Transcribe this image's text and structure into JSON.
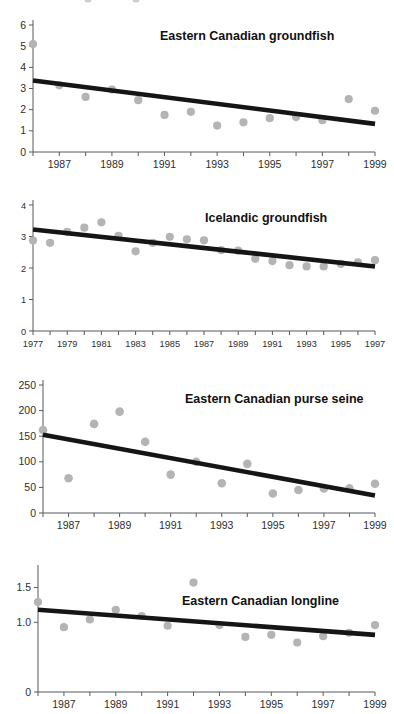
{
  "figure": {
    "background": "#ffffff",
    "point_color": "#b4b4b4",
    "trend_color": "#151515",
    "axis_color": "#555b5e",
    "title_color": "#111111"
  },
  "chart_data": [
    {
      "id": "eastern-canadian-groundfish",
      "type": "scatter",
      "title": "Eastern Canadian groundfish",
      "xlabel": "",
      "ylabel": "",
      "xlim": [
        1986,
        1999
      ],
      "ylim": [
        0,
        6
      ],
      "yticks": [
        0,
        1,
        2,
        3,
        4,
        5,
        6
      ],
      "ytick_labels": [
        "0",
        "1",
        "2",
        "3",
        "4",
        "5",
        "6"
      ],
      "xticks": [
        1986,
        1987,
        1988,
        1989,
        1990,
        1991,
        1992,
        1993,
        1994,
        1995,
        1996,
        1997,
        1998,
        1999
      ],
      "xtick_labels": [
        "",
        "1987",
        "",
        "1989",
        "",
        "1991",
        "",
        "1993",
        "",
        "1995",
        "",
        "1997",
        "",
        "1999"
      ],
      "grid": false,
      "legend": "none",
      "x": [
        1986,
        1987,
        1988,
        1989,
        1990,
        1991,
        1992,
        1993,
        1994,
        1995,
        1996,
        1997,
        1998,
        1999
      ],
      "y": [
        5.1,
        3.15,
        2.6,
        2.95,
        2.45,
        1.75,
        1.9,
        1.25,
        1.4,
        1.6,
        1.65,
        1.5,
        2.5,
        1.95
      ],
      "trendline": {
        "x": [
          1986,
          1999
        ],
        "y": [
          3.38,
          1.33
        ]
      }
    },
    {
      "id": "icelandic-groundfish",
      "type": "scatter",
      "title": "Icelandic groundfish",
      "xlabel": "",
      "ylabel": "",
      "xlim": [
        1977,
        1997
      ],
      "ylim": [
        0,
        4
      ],
      "yticks": [
        0,
        1,
        2,
        3,
        4
      ],
      "ytick_labels": [
        "0",
        "1",
        "2",
        "3",
        "4"
      ],
      "xticks": [
        1977,
        1978,
        1979,
        1980,
        1981,
        1982,
        1983,
        1984,
        1985,
        1986,
        1987,
        1988,
        1989,
        1990,
        1991,
        1992,
        1993,
        1994,
        1995,
        1996,
        1997
      ],
      "xtick_labels": [
        "1977",
        "",
        "1979",
        "",
        "1981",
        "",
        "1983",
        "",
        "1985",
        "",
        "1987",
        "",
        "1989",
        "",
        "1991",
        "",
        "1993",
        "",
        "1995",
        "",
        "1997"
      ],
      "grid": false,
      "legend": "none",
      "x": [
        1977,
        1978,
        1979,
        1980,
        1981,
        1982,
        1983,
        1984,
        1985,
        1986,
        1987,
        1988,
        1989,
        1990,
        1991,
        1992,
        1993,
        1994,
        1995,
        1996,
        1997
      ],
      "y": [
        2.87,
        2.8,
        3.15,
        3.28,
        3.45,
        3.02,
        2.53,
        2.8,
        2.99,
        2.91,
        2.88,
        2.57,
        2.55,
        2.29,
        2.22,
        2.09,
        2.05,
        2.05,
        2.13,
        2.18,
        2.25
      ],
      "trendline": {
        "x": [
          1977,
          1997
        ],
        "y": [
          3.22,
          2.05
        ]
      }
    },
    {
      "id": "eastern-canadian-purse-seine",
      "type": "scatter",
      "title": "Eastern Canadian purse seine",
      "xlabel": "",
      "ylabel": "",
      "xlim": [
        1986,
        1999
      ],
      "ylim": [
        0,
        250
      ],
      "yticks": [
        0,
        50,
        100,
        150,
        200,
        250
      ],
      "ytick_labels": [
        "0",
        "50",
        "100",
        "150",
        "200",
        "250"
      ],
      "xticks": [
        1986,
        1987,
        1988,
        1989,
        1990,
        1991,
        1992,
        1993,
        1994,
        1995,
        1996,
        1997,
        1998,
        1999
      ],
      "xtick_labels": [
        "",
        "1987",
        "",
        "1989",
        "",
        "1991",
        "",
        "1993",
        "",
        "1995",
        "",
        "1997",
        "",
        "1999"
      ],
      "grid": false,
      "legend": "none",
      "x": [
        1986,
        1987,
        1988,
        1989,
        1990,
        1991,
        1992,
        1993,
        1994,
        1995,
        1996,
        1997,
        1998,
        1999
      ],
      "y": [
        162,
        68,
        174,
        198,
        139,
        75,
        100,
        58,
        96,
        38,
        45,
        48,
        48,
        57
      ],
      "trendline": {
        "x": [
          1986,
          1999
        ],
        "y": [
          153,
          34
        ]
      }
    },
    {
      "id": "eastern-canadian-longline",
      "type": "scatter",
      "title": "Eastern Canadian longline",
      "xlabel": "",
      "ylabel": "",
      "xlim": [
        1986,
        1999
      ],
      "ylim": [
        0,
        1.75
      ],
      "yticks": [
        0,
        1.0,
        1.5
      ],
      "ytick_labels": [
        "0",
        "1.0",
        "1.5"
      ],
      "xticks": [
        1986,
        1987,
        1988,
        1989,
        1990,
        1991,
        1992,
        1993,
        1994,
        1995,
        1996,
        1997,
        1998,
        1999
      ],
      "xtick_labels": [
        "",
        "1987",
        "",
        "1989",
        "",
        "1991",
        "",
        "1993",
        "",
        "1995",
        "",
        "1997",
        "",
        "1999"
      ],
      "grid": false,
      "legend": "none",
      "x": [
        1986,
        1987,
        1988,
        1989,
        1990,
        1991,
        1992,
        1993,
        1994,
        1995,
        1996,
        1997,
        1998,
        1999
      ],
      "y": [
        1.29,
        0.93,
        1.04,
        1.18,
        1.09,
        0.95,
        1.57,
        0.96,
        0.79,
        0.82,
        0.71,
        0.8,
        0.85,
        0.96
      ],
      "trendline": {
        "x": [
          1986,
          1999
        ],
        "y": [
          1.18,
          0.82
        ]
      }
    }
  ]
}
